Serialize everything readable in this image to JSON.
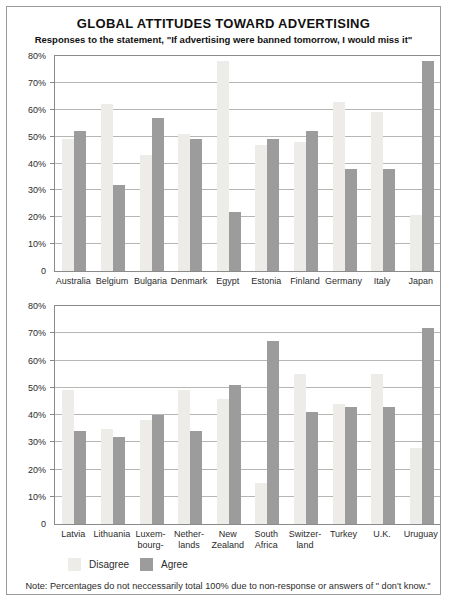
{
  "figure": {
    "title": "GLOBAL ATTITUDES TOWARD ADVERTISING",
    "subtitle": "Responses to the statement, \"If advertising were banned tomorrow, I would miss it\"",
    "note": "Note: Percentages do not neccessarily total 100% due to non-response or answers of \" don't know.\""
  },
  "legend": {
    "position": "bottom-left",
    "items": [
      {
        "label": "Disagree",
        "color": "#edece8"
      },
      {
        "label": "Agree",
        "color": "#9c9c9c"
      }
    ]
  },
  "colors": {
    "disagree": "#edece8",
    "agree": "#9c9c9c",
    "gridline": "#b6b6b4",
    "plot_border": "#8a8a8a",
    "figure_border": "#9a9a9a",
    "text": "#222222"
  },
  "chart_data": [
    {
      "type": "bar",
      "title": "",
      "xlabel": "",
      "ylabel": "",
      "ylim": [
        0,
        80
      ],
      "grid": true,
      "ytick_labels": [
        "80%",
        "70%",
        "60%",
        "50%",
        "40%",
        "30%",
        "20%",
        "10%",
        "0"
      ],
      "categories": [
        "Australia",
        "Belgium",
        "Bulgaria",
        "Denmark",
        "Egypt",
        "Estonia",
        "Finland",
        "Germany",
        "Italy",
        "Japan"
      ],
      "tick_lines": [
        [
          "Australia"
        ],
        [
          "Belgium"
        ],
        [
          "Bulgaria"
        ],
        [
          "Denmark"
        ],
        [
          "Egypt"
        ],
        [
          "Estonia"
        ],
        [
          "Finland"
        ],
        [
          "Germany"
        ],
        [
          "Italy"
        ],
        [
          "Japan"
        ]
      ],
      "series": [
        {
          "name": "Disagree",
          "values": [
            49,
            62,
            43,
            51,
            78,
            47,
            48,
            63,
            59,
            21
          ]
        },
        {
          "name": "Agree",
          "values": [
            52,
            32,
            57,
            49,
            22,
            49,
            52,
            38,
            38,
            78
          ]
        }
      ]
    },
    {
      "type": "bar",
      "title": "",
      "xlabel": "",
      "ylabel": "",
      "ylim": [
        0,
        80
      ],
      "grid": true,
      "ytick_labels": [
        "80%",
        "70%",
        "60%",
        "50%",
        "40%",
        "30%",
        "20%",
        "10%",
        "0"
      ],
      "categories": [
        "Latvia",
        "Lithuania",
        "Luxembourg",
        "Netherlands",
        "New Zealand",
        "South Africa",
        "Switzerland",
        "Turkey",
        "U.K.",
        "Uruguay"
      ],
      "tick_lines": [
        [
          "Latvia"
        ],
        [
          "Lithuania"
        ],
        [
          "Luxem-",
          "bourg-"
        ],
        [
          "Nether-",
          "lands"
        ],
        [
          "New",
          "Zealand"
        ],
        [
          "South",
          "Africa"
        ],
        [
          "Switzer-",
          "land"
        ],
        [
          "Turkey"
        ],
        [
          "U.K."
        ],
        [
          "Uruguay"
        ]
      ],
      "series": [
        {
          "name": "Disagree",
          "values": [
            49,
            35,
            38,
            49,
            46,
            15,
            55,
            44,
            55,
            28
          ]
        },
        {
          "name": "Agree",
          "values": [
            34,
            32,
            40,
            34,
            51,
            67,
            41,
            43,
            43,
            72
          ]
        }
      ]
    }
  ]
}
